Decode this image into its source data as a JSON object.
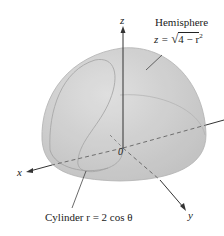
{
  "diagram": {
    "labels": {
      "hemisphere_title": "Hemisphere",
      "hemisphere_eq_lhs": "z = ",
      "hemisphere_eq_rad": "4 − r",
      "hemisphere_eq_exp": "2",
      "cylinder_label": "Cylinder r = 2 cos θ",
      "axis_z": "z",
      "axis_x": "x",
      "axis_y": "y",
      "origin": "0"
    },
    "colors": {
      "surface": "#c9c9c9",
      "surface_dark": "#b5b5b5",
      "axis": "#333333",
      "background": "#ffffff"
    }
  }
}
